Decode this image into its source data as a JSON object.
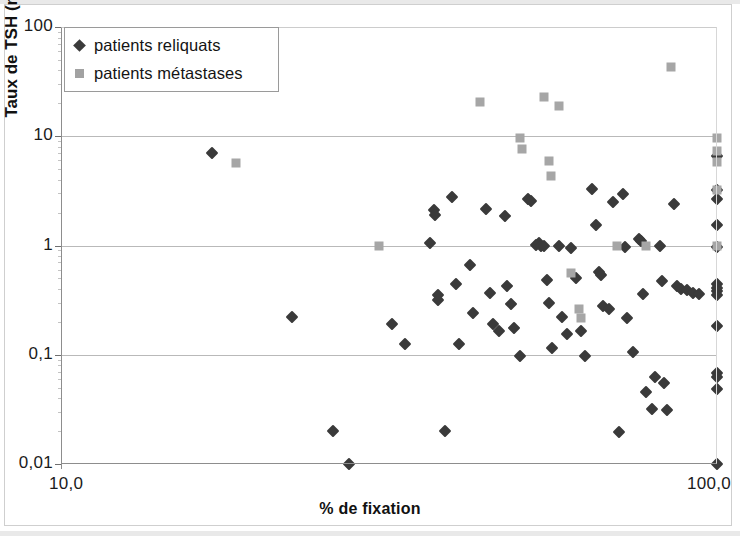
{
  "chart_data": {
    "type": "scatter",
    "title": "",
    "xlabel": "% de fixation",
    "ylabel": "Taux de TSH (mUI/L)",
    "xscale": "log",
    "yscale": "log",
    "xlim": [
      10.0,
      100.0
    ],
    "ylim": [
      0.01,
      100
    ],
    "grid": true,
    "xticks": [
      10.0,
      100.0
    ],
    "xticklabels": [
      "10,0",
      "100,0"
    ],
    "yticks": [
      0.01,
      0.1,
      1,
      10,
      100
    ],
    "yticklabels": [
      "0,01",
      "0,1",
      "1",
      "10",
      "100"
    ],
    "legend_position": "upper-left",
    "series": [
      {
        "name": "patients reliquats",
        "marker": "diamond",
        "color": "#3a3a3a",
        "points": [
          [
            17.0,
            7.0
          ],
          [
            22.5,
            0.22
          ],
          [
            26.0,
            0.02
          ],
          [
            27.5,
            0.01
          ],
          [
            32.0,
            0.19
          ],
          [
            33.5,
            0.125
          ],
          [
            36.5,
            1.05
          ],
          [
            37.0,
            2.1
          ],
          [
            37.2,
            1.9
          ],
          [
            37.5,
            0.35
          ],
          [
            37.6,
            0.32
          ],
          [
            38.5,
            0.02
          ],
          [
            39.5,
            2.8
          ],
          [
            40.0,
            0.44
          ],
          [
            40.5,
            0.125
          ],
          [
            42.0,
            0.66
          ],
          [
            42.5,
            0.24
          ],
          [
            44.5,
            2.15
          ],
          [
            45.0,
            0.37
          ],
          [
            45.5,
            0.19
          ],
          [
            46.5,
            0.165
          ],
          [
            47.5,
            1.85
          ],
          [
            47.8,
            0.43
          ],
          [
            48.5,
            0.29
          ],
          [
            49.0,
            0.175
          ],
          [
            50.0,
            0.098
          ],
          [
            51.5,
            2.65
          ],
          [
            52.0,
            2.55
          ],
          [
            53.0,
            1.02
          ],
          [
            53.5,
            1.05
          ],
          [
            54.0,
            1.0
          ],
          [
            54.5,
            0.98
          ],
          [
            55.0,
            0.48
          ],
          [
            55.5,
            0.3
          ],
          [
            56.0,
            0.115
          ],
          [
            57.5,
            1.0
          ],
          [
            58.0,
            0.22
          ],
          [
            59.0,
            0.155
          ],
          [
            60.0,
            0.94
          ],
          [
            61.0,
            0.5
          ],
          [
            62.0,
            0.165
          ],
          [
            63.0,
            0.098
          ],
          [
            64.5,
            3.3
          ],
          [
            65.5,
            1.55
          ],
          [
            66.0,
            0.57
          ],
          [
            66.5,
            0.54
          ],
          [
            67.0,
            0.28
          ],
          [
            68.5,
            0.26
          ],
          [
            69.5,
            2.5
          ],
          [
            71.0,
            0.0195
          ],
          [
            72.0,
            2.95
          ],
          [
            72.5,
            0.96
          ],
          [
            73.0,
            0.215
          ],
          [
            74.5,
            0.105
          ],
          [
            76.0,
            1.15
          ],
          [
            76.5,
            1.1
          ],
          [
            77.0,
            0.36
          ],
          [
            78.0,
            0.046
          ],
          [
            79.5,
            0.032
          ],
          [
            80.5,
            0.062
          ],
          [
            82.0,
            1.0
          ],
          [
            82.5,
            0.47
          ],
          [
            83.0,
            0.055
          ],
          [
            84.0,
            0.031
          ],
          [
            86.0,
            2.4
          ],
          [
            87.0,
            0.43
          ],
          [
            88.0,
            0.4
          ],
          [
            90.0,
            0.39
          ],
          [
            92.0,
            0.37
          ],
          [
            94.0,
            0.36
          ],
          [
            100.0,
            6.6
          ],
          [
            100.0,
            3.2
          ],
          [
            100.0,
            2.65
          ],
          [
            100.0,
            1.55
          ],
          [
            100.0,
            0.97
          ],
          [
            100.0,
            0.44
          ],
          [
            100.0,
            0.41
          ],
          [
            100.0,
            0.38
          ],
          [
            100.0,
            0.355
          ],
          [
            100.0,
            0.185
          ],
          [
            100.0,
            0.068
          ],
          [
            100.0,
            0.062
          ],
          [
            100.0,
            0.049
          ],
          [
            100.0,
            0.01
          ]
        ]
      },
      {
        "name": "patients métastases",
        "marker": "square",
        "color": "#a6a6a6",
        "points": [
          [
            18.5,
            5.7
          ],
          [
            30.5,
            1.0
          ],
          [
            43.5,
            20.5
          ],
          [
            50.0,
            9.7
          ],
          [
            50.5,
            7.7
          ],
          [
            54.5,
            23.0
          ],
          [
            55.5,
            5.9
          ],
          [
            55.8,
            4.3
          ],
          [
            57.5,
            19.0
          ],
          [
            60.0,
            0.56
          ],
          [
            61.5,
            0.26
          ],
          [
            62.0,
            0.215
          ],
          [
            70.5,
            1.0
          ],
          [
            78.0,
            1.0
          ],
          [
            85.0,
            43.0
          ],
          [
            100.0,
            9.6
          ],
          [
            100.0,
            7.3
          ],
          [
            100.0,
            5.8
          ],
          [
            100.0,
            3.2
          ],
          [
            100.0,
            1.0
          ]
        ]
      }
    ]
  },
  "legend": {
    "entries": [
      {
        "label": "patients reliquats",
        "marker": "diamond"
      },
      {
        "label": "patients métastases",
        "marker": "square"
      }
    ]
  }
}
